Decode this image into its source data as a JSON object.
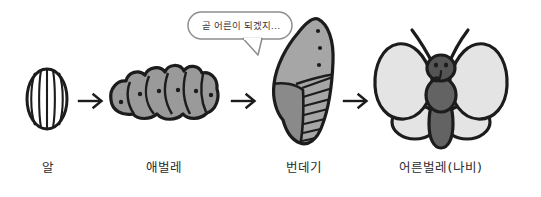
{
  "diagram": {
    "background_color": "#ffffff",
    "width": 541,
    "height": 197
  },
  "palette": {
    "outline": "#1c1c1c",
    "egg_fill": "#ffffff",
    "larva_fill": "#9a9a9a",
    "pupa_fill_light": "#a6a6a6",
    "pupa_fill_dark": "#8a8a8a",
    "wing_fill": "#e4e4e4",
    "body_fill": "#636363",
    "head_fill": "#555555",
    "bubble_fill": "#ffffff",
    "bubble_stroke": "#8d8d8d",
    "text_color": "#2b2b2b"
  },
  "speech_bubble": {
    "text": "곧 어른이 되겠지…",
    "speaker": "번데기"
  },
  "stages": [
    {
      "id": "egg",
      "label": "알",
      "icon": "egg-icon",
      "rib_count": 5
    },
    {
      "id": "larva",
      "label": "애벌레",
      "icon": "caterpillar-icon",
      "segment_count": 6
    },
    {
      "id": "pupa",
      "label": "번데기",
      "icon": "chrysalis-icon",
      "spot_count": 3,
      "stripe_count": 7
    },
    {
      "id": "adult",
      "label": "어른벌레(나비)",
      "icon": "butterfly-icon",
      "antenna_count": 2,
      "wing_count": 4
    }
  ],
  "arrows": [
    {
      "id": "arrow-egg-to-larva",
      "glyph": "→",
      "from": "알",
      "to": "애벌레"
    },
    {
      "id": "arrow-larva-to-pupa",
      "glyph": "→",
      "from": "애벌레",
      "to": "번데기"
    },
    {
      "id": "arrow-pupa-to-adult",
      "glyph": "→",
      "from": "번데기",
      "to": "어른벌레(나비)"
    }
  ]
}
